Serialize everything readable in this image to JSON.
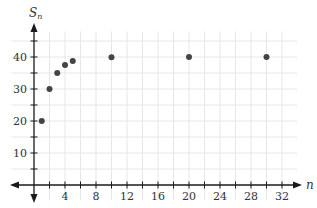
{
  "chart_data": {
    "type": "scatter",
    "title": "",
    "xlabel": "n",
    "ylabel": "S_n",
    "ylabel_main": "S",
    "ylabel_sub": "n",
    "xlim": [
      0,
      33
    ],
    "ylim": [
      0,
      48
    ],
    "x_ticks": [
      4,
      8,
      12,
      16,
      20,
      24,
      28,
      32
    ],
    "x_tick_labels": [
      "4",
      "8",
      "12",
      "16",
      "20",
      "24",
      "28",
      "32"
    ],
    "y_ticks": [
      10,
      20,
      30,
      40
    ],
    "y_tick_labels": [
      "10",
      "20",
      "30",
      "40"
    ],
    "grid": true,
    "grid_x_step": 2,
    "grid_y_step": 5,
    "legend": null,
    "series": [
      {
        "name": "S_n",
        "color": "#444444",
        "points": [
          {
            "x": 1,
            "y": 20
          },
          {
            "x": 2,
            "y": 30
          },
          {
            "x": 3,
            "y": 35
          },
          {
            "x": 4,
            "y": 37.5
          },
          {
            "x": 5,
            "y": 38.75
          },
          {
            "x": 10,
            "y": 39.96
          },
          {
            "x": 20,
            "y": 40
          },
          {
            "x": 30,
            "y": 40
          }
        ]
      }
    ]
  },
  "colors": {
    "axis": "#1a1a1a",
    "grid": "#e6e6e6",
    "point": "#444444"
  }
}
